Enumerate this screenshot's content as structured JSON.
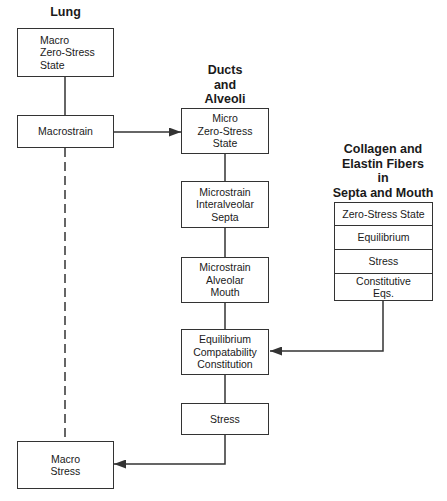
{
  "columns": {
    "lung": {
      "heading": "Lung"
    },
    "ducts": {
      "heading": "Ducts\nand\nAlveoli"
    },
    "fibers": {
      "heading": "Collagen and\nElastin Fibers\nin\nSepta and Mouth"
    }
  },
  "nodes": {
    "macro_zero_stress": "Macro\nZero-Stress\nState",
    "macrostrain": "Macrostrain",
    "macro_stress": "Macro\nStress",
    "micro_zero_stress": "Micro\nZero-Stress\nState",
    "microstrain_septa": "Microstrain\nInteralveolar\nSepta",
    "microstrain_mouth": "Microstrain\nAlveolar\nMouth",
    "equilibrium_block": "Equilibrium\nCompatability\nConstitution",
    "stress": "Stress"
  },
  "fiber_stack": {
    "rows": [
      "Zero-Stress State",
      "Equilibrium",
      "Stress",
      "Constitutive\nEqs."
    ]
  },
  "edges": [
    {
      "from": "macro_zero_stress",
      "to": "macrostrain",
      "style": "solid"
    },
    {
      "from": "macrostrain",
      "to": "micro_zero_stress",
      "style": "arrow"
    },
    {
      "from": "macrostrain",
      "to": "macro_stress",
      "style": "dashed"
    },
    {
      "from": "micro_zero_stress",
      "to": "microstrain_septa",
      "style": "solid"
    },
    {
      "from": "microstrain_septa",
      "to": "microstrain_mouth",
      "style": "solid"
    },
    {
      "from": "microstrain_mouth",
      "to": "equilibrium_block",
      "style": "solid"
    },
    {
      "from": "fiber_stack",
      "to": "equilibrium_block",
      "style": "arrow"
    },
    {
      "from": "equilibrium_block",
      "to": "stress",
      "style": "solid"
    },
    {
      "from": "stress",
      "to": "macro_stress",
      "style": "arrow"
    }
  ],
  "colors": {
    "line": "#333333",
    "text": "#1a1a1a",
    "background": "#ffffff"
  }
}
